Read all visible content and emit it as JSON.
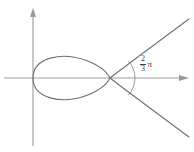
{
  "figure": {
    "background_color": "#ffffff",
    "curve_color": "#6e6e6e",
    "axis_color": "#9b9b9b",
    "label_color": "#3a3a3a"
  },
  "axes": {
    "x_axis_name": "horizontal-axis",
    "y_axis_name": "vertical-axis",
    "origin_x": 33,
    "origin_y": 78,
    "x_axis_arrow": "arrow-right",
    "y_axis_arrow": "arrow-up"
  },
  "angle": {
    "numerator": "2",
    "denominator": "3",
    "symbol": "π",
    "vertex_x": 110,
    "vertex_y": 78,
    "arc_radius": 25
  },
  "chart_data": {
    "type": "line",
    "xlabel": "",
    "ylabel": "",
    "grid": false,
    "legend": false,
    "annotations": [
      {
        "text": "2/3 π",
        "kind": "angle-label",
        "x": 140,
        "y": 55
      }
    ],
    "features": {
      "node_point": [
        110,
        78
      ],
      "loop_left_extent": [
        33,
        78
      ],
      "loop_top": [
        60,
        55
      ],
      "loop_bottom": [
        60,
        102
      ],
      "branch_upper_end": [
        188,
        22
      ],
      "branch_lower_end": [
        188,
        134
      ]
    },
    "series": [
      {
        "name": "loop",
        "path": "M 33 78 C 33 57, 62 52, 85 60 C 99 65, 107 72, 110 78 C 107 84, 99 91, 85 96 C 62 104, 33 99, 33 78 Z"
      },
      {
        "name": "upper-branch",
        "path": "M 110 78 C 128 64, 158 42, 189 19"
      },
      {
        "name": "lower-branch",
        "path": "M 110 78 C 128 92, 158 114, 189 137"
      }
    ]
  }
}
